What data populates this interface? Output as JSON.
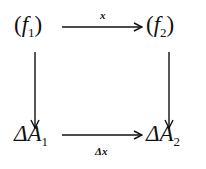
{
  "diagram": {
    "type": "commutative-square",
    "nodes": {
      "top_left": {
        "open": "(",
        "symbol": "f",
        "sub": "1",
        "close": ")"
      },
      "top_right": {
        "open": "(",
        "symbol": "f",
        "sub": "2",
        "close": ")"
      },
      "bottom_left": {
        "prefix": "Δ",
        "symbol": "A",
        "sub": "1"
      },
      "bottom_right": {
        "prefix": "Δ",
        "symbol": "A",
        "sub": "2"
      }
    },
    "edges": {
      "top": {
        "from": "top_left",
        "to": "top_right",
        "label": "x"
      },
      "bottom": {
        "from": "bottom_left",
        "to": "bottom_right",
        "label": "Δx"
      },
      "left": {
        "from": "top_left",
        "to": "bottom_left",
        "label": ""
      },
      "right": {
        "from": "top_right",
        "to": "bottom_right",
        "label": ""
      }
    }
  }
}
